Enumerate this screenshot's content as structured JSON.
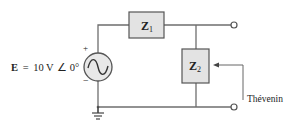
{
  "diagram": {
    "type": "circuit",
    "source": {
      "label_symbol": "E",
      "label_eq": "=",
      "magnitude": "10 V",
      "angle_symbol": "∠",
      "angle": "0°",
      "plus": "+",
      "minus": "−"
    },
    "components": [
      {
        "id": "Z1",
        "symbol": "Z",
        "subscript": "1"
      },
      {
        "id": "Z2",
        "symbol": "Z",
        "subscript": "2"
      }
    ],
    "annotation": "Thévenin",
    "colors": {
      "wire": "#6e6e6e",
      "box_fill": "#e3e3e3",
      "box_stroke": "#555555"
    }
  }
}
